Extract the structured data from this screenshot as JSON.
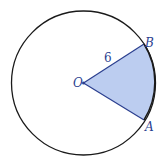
{
  "figure": {
    "type": "circle-sector",
    "colors": {
      "circle_stroke": "#1a1a1a",
      "sector_fill": "#bccdf0",
      "sector_stroke": "#2b3f8f",
      "label_color": "#2b3f8f"
    },
    "circle": {
      "cx": 83.5,
      "cy": 83,
      "r": 72
    },
    "points": {
      "O": {
        "label": "O",
        "x": 83.5,
        "y": 83
      },
      "A": {
        "label": "A",
        "x": 144,
        "y": 120
      },
      "B": {
        "label": "B",
        "x": 144,
        "y": 44
      }
    },
    "radius_label": "6"
  }
}
